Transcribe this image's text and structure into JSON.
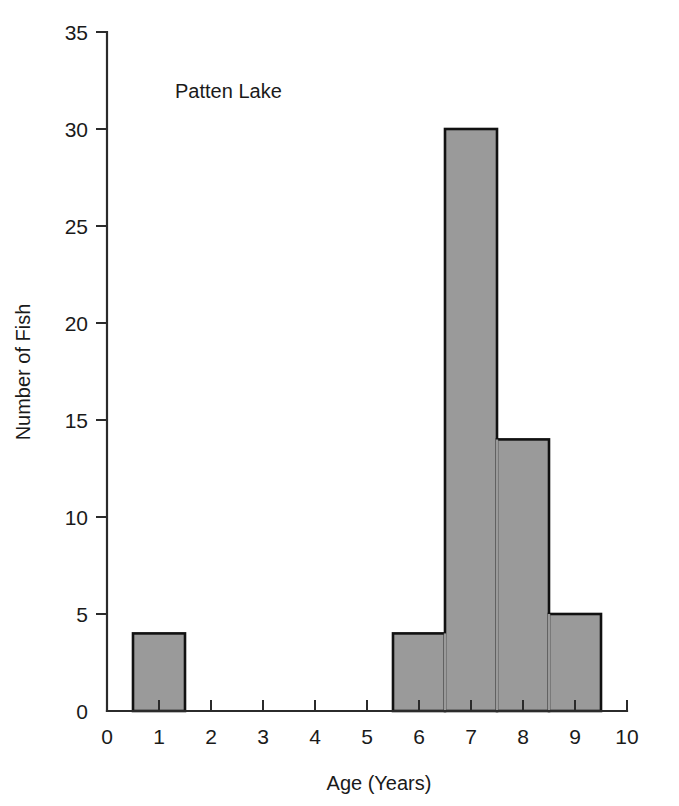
{
  "chart_data": {
    "type": "bar",
    "title": "",
    "annotation": "Patten Lake",
    "xlabel": "Age (Years)",
    "ylabel": "Number of Fish",
    "xlim": [
      0,
      10
    ],
    "ylim": [
      0,
      35
    ],
    "xticks": [
      "0",
      "1",
      "2",
      "3",
      "4",
      "5",
      "6",
      "7",
      "8",
      "9",
      "10"
    ],
    "xtick_values": [
      0,
      1,
      2,
      3,
      4,
      5,
      6,
      7,
      8,
      9,
      10
    ],
    "yticks": [
      "0",
      "5",
      "10",
      "15",
      "20",
      "25",
      "30",
      "35"
    ],
    "ytick_values": [
      0,
      5,
      10,
      15,
      20,
      25,
      30,
      35
    ],
    "grid": false,
    "legend": null,
    "bin_width": 1,
    "categories": [
      "1",
      "2",
      "3",
      "4",
      "5",
      "6",
      "7",
      "8",
      "9"
    ],
    "values": [
      4,
      0,
      0,
      0,
      0,
      4,
      30,
      14,
      5
    ],
    "bars": [
      {
        "center": 1,
        "x0": 0.5,
        "x1": 1.5,
        "value": 4
      },
      {
        "center": 6,
        "x0": 5.5,
        "x1": 6.5,
        "value": 4
      },
      {
        "center": 7,
        "x0": 6.5,
        "x1": 7.5,
        "value": 30
      },
      {
        "center": 8,
        "x0": 7.5,
        "x1": 8.5,
        "value": 14
      },
      {
        "center": 9,
        "x0": 8.5,
        "x1": 9.5,
        "value": 5
      }
    ],
    "bar_fill": "#9a9a9a",
    "bar_stroke": "#111111",
    "axis_color": "#2b2b2b",
    "background": "#ffffff"
  }
}
